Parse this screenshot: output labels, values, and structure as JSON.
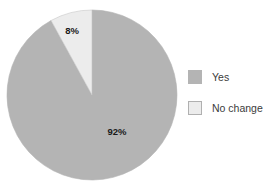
{
  "chart_data": {
    "type": "pie",
    "title": "",
    "subtitle": "",
    "xlabel": "",
    "ylabel": "",
    "grid": false,
    "legend_position": "right",
    "start_angle_deg": 90,
    "direction": "clockwise",
    "categories": [
      "Yes",
      "No change"
    ],
    "values": [
      92,
      8
    ],
    "value_unit": "%",
    "slices": [
      {
        "label": "Yes",
        "value": 92,
        "data_label": "92%",
        "color": "#b4b4b4",
        "border_color": "#b4b4b4"
      },
      {
        "label": "No change",
        "value": 8,
        "data_label": "8%",
        "color": "#ececec",
        "border_color": "#c8c8c8"
      }
    ],
    "legend": [
      {
        "label": "Yes",
        "color": "#b4b4b4",
        "border_color": "#b4b4b4"
      },
      {
        "label": "No change",
        "color": "#ececec",
        "border_color": "#b0b0b0"
      }
    ]
  },
  "geometry": {
    "center_x": 92,
    "center_y": 95,
    "radius": 85,
    "label_8_x": 72,
    "label_8_y": 31,
    "label_92_x": 117,
    "label_92_y": 132
  },
  "colors": {
    "background": "#ffffff",
    "slice_yes": "#b4b4b4",
    "slice_no_change": "#ececec",
    "label_text": "#1a1a1a",
    "legend_text": "#3b3b3b"
  }
}
